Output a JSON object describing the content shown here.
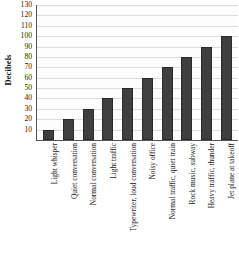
{
  "chart_data": {
    "type": "bar",
    "title": "",
    "xlabel": "",
    "ylabel": "Decibels",
    "ylim": [
      0,
      130
    ],
    "ytick_step": 10,
    "yticks": [
      130,
      120,
      110,
      100,
      90,
      80,
      70,
      60,
      50,
      40,
      30,
      20,
      10
    ],
    "grid": true,
    "legend": "none",
    "bar_color": "#3f3f3f",
    "categories": [
      "Light whisper",
      "Quiet conversation",
      "Normal conversation",
      "Light traffic",
      "Typewriter, loud conversation",
      "Noisy office",
      "Normal traffic, quiet train",
      "Rock music, subway",
      "Heavy traffic, thunder",
      "Jet plane at takeoff"
    ],
    "values": [
      10,
      20,
      30,
      40,
      50,
      60,
      70,
      80,
      90,
      100
    ]
  }
}
